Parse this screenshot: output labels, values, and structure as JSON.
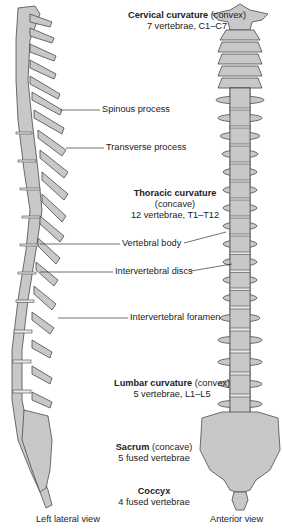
{
  "colors": {
    "bone_fill": "#c8c8c8",
    "bone_stroke": "#4a4a4a",
    "disc_fill": "#e4e4e4",
    "text": "#222222",
    "background": "#ffffff"
  },
  "regions": {
    "cervical": {
      "name": "Cervical curvature",
      "type": "(convex)",
      "detail": "7 vertebrae, C1–C7"
    },
    "thoracic": {
      "name": "Thoracic curvature",
      "type": "(concave)",
      "detail": "12 vertebrae, T1–T12"
    },
    "lumbar": {
      "name": "Lumbar curvature",
      "type": "(convex)",
      "detail": "5 vertebrae, L1–L5"
    },
    "sacrum": {
      "name": "Sacrum",
      "type": "(concave)",
      "detail": "5 fused vertebrae"
    },
    "coccyx": {
      "name": "Coccyx",
      "detail": "4 fused vertebrae"
    }
  },
  "callouts": {
    "spinous": "Spinous process",
    "transverse": "Transverse process",
    "body": "Vertebral body",
    "discs": "Intervertebral discs",
    "foramen": "Intervertebral foramen"
  },
  "views": {
    "left": "Left lateral view",
    "right": "Anterior view"
  }
}
